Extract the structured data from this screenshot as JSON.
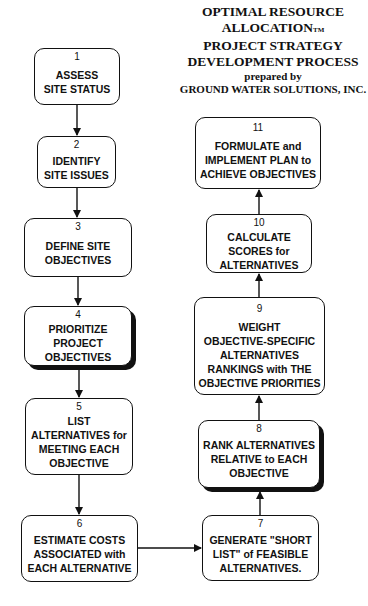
{
  "header": {
    "title_lines": [
      "OPTIMAL RESOURCE",
      "ALLOCATION",
      "PROJECT STRATEGY",
      "DEVELOPMENT PROCESS"
    ],
    "trademark": "TM",
    "prepared_by": "prepared by",
    "organization": "GROUND WATER SOLUTIONS, INC."
  },
  "steps": [
    {
      "number": "1",
      "label": "ASSESS\nSITE STATUS"
    },
    {
      "number": "2",
      "label": "IDENTIFY\nSITE ISSUES"
    },
    {
      "number": "3",
      "label": "DEFINE SITE\nOBJECTIVES"
    },
    {
      "number": "4",
      "label": "PRIORITIZE\nPROJECT\nOBJECTIVES"
    },
    {
      "number": "5",
      "label": "LIST\nALTERNATIVES for\nMEETING EACH\nOBJECTIVE"
    },
    {
      "number": "6",
      "label": "ESTIMATE COSTS\nASSOCIATED with\nEACH ALTERNATIVE"
    },
    {
      "number": "7",
      "label": "GENERATE \"SHORT\nLIST\" of FEASIBLE\nALTERNATIVES."
    },
    {
      "number": "8",
      "label": "RANK ALTERNATIVES\nRELATIVE to EACH\nOBJECTIVE"
    },
    {
      "number": "9",
      "label": "WEIGHT\nOBJECTIVE-SPECIFIC\nALTERNATIVES\nRANKINGS with THE\nOBJECTIVE PRIORITIES"
    },
    {
      "number": "10",
      "label": "CALCULATE\nSCORES for\nALTERNATIVES"
    },
    {
      "number": "11",
      "label": "FORMULATE and\nIMPLEMENT PLAN to\nACHIEVE OBJECTIVES"
    }
  ],
  "connections": [
    {
      "from": "1",
      "to": "2"
    },
    {
      "from": "2",
      "to": "3"
    },
    {
      "from": "3",
      "to": "4"
    },
    {
      "from": "4",
      "to": "5"
    },
    {
      "from": "5",
      "to": "6"
    },
    {
      "from": "6",
      "to": "7"
    },
    {
      "from": "7",
      "to": "8"
    },
    {
      "from": "8",
      "to": "9"
    },
    {
      "from": "9",
      "to": "10"
    },
    {
      "from": "10",
      "to": "11"
    }
  ]
}
